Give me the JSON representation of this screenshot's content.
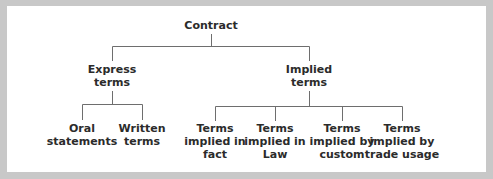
{
  "diagram": {
    "type": "tree",
    "root": {
      "label": "Contract",
      "children": [
        {
          "label": "Express\nterms",
          "children": [
            {
              "label": "Oral\nstatements"
            },
            {
              "label": "Written\nterms"
            }
          ]
        },
        {
          "label": "Implied\nterms",
          "children": [
            {
              "label": "Terms\nimplied in\nfact"
            },
            {
              "label": "Terms\nimplied in\nLaw"
            },
            {
              "label": "Terms\nimplied by\ncustom"
            },
            {
              "label": "Terms\nimplied by\ntrade usage"
            }
          ]
        }
      ]
    },
    "colors": {
      "line": "#6e6e6e",
      "text": "#2b2b2b",
      "frame": "#c8c8c8",
      "background": "#ffffff"
    }
  }
}
